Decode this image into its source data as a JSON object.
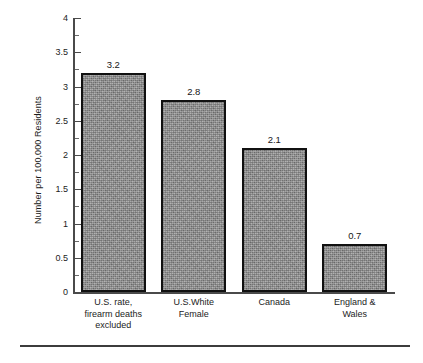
{
  "chart_data": {
    "type": "bar",
    "title": "",
    "subtitle": "",
    "xlabel": "",
    "ylabel": "Number per 100,000 Residents",
    "categories": [
      "U.S. rate,\nfirearm deaths\nexcluded",
      "U.S.White\nFemale",
      "Canada",
      "England &\nWales"
    ],
    "category_lines": [
      [
        "U.S. rate,",
        "firearm deaths",
        "excluded"
      ],
      [
        "U.S.White",
        "Female"
      ],
      [
        "Canada"
      ],
      [
        "England &",
        "Wales"
      ]
    ],
    "values": [
      3.2,
      2.8,
      2.1,
      0.7
    ],
    "data_labels": [
      "3.2",
      "2.8",
      "2.1",
      "0.7"
    ],
    "ylim": [
      0,
      4
    ],
    "ytick_values": [
      0,
      0.5,
      1,
      1.5,
      2,
      2.5,
      3,
      3.5,
      4
    ],
    "ytick_labels": [
      "0",
      "0.5",
      "1",
      "1.5",
      "2",
      "2.5",
      "3",
      "3.5",
      "4"
    ],
    "yminor_values": [
      0.25,
      0.75,
      1.25,
      1.75,
      2.25,
      2.75,
      3.25,
      3.75
    ],
    "grid": false,
    "legend": false,
    "legend_position": "none",
    "bar_fill_color": "#8e8e8e",
    "bar_edge_color": "#111111",
    "axis_color": "#4a4a4a",
    "text_color": "#1c1c1c",
    "background_color": "#ffffff"
  },
  "figure": {
    "has_bottom_rule": true,
    "bottom_rule_color": "#3c3c3c"
  }
}
